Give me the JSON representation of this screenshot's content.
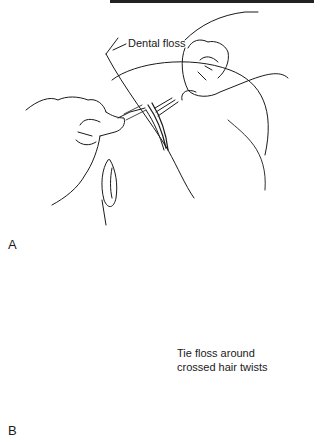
{
  "figure": {
    "panels": [
      {
        "letter": "A",
        "annotation": "Dental floss"
      },
      {
        "letter": "B",
        "annotation_line1": "Tie floss around",
        "annotation_line2": "crossed hair twists"
      }
    ],
    "colors": {
      "line": "#1a1a1a",
      "background": "#ffffff"
    }
  }
}
